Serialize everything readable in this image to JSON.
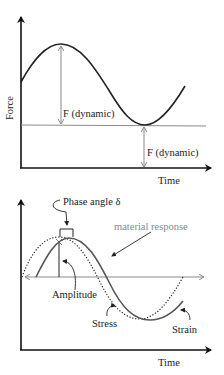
{
  "figure": {
    "top_panel": {
      "y_axis_label": "Force",
      "x_axis_label": "Time",
      "annotations": [
        "F (dynamic)",
        "F (dynamic)"
      ],
      "curve": "sinusoidal force"
    },
    "bottom_panel": {
      "x_axis_label": "Time",
      "annotations": {
        "phase_angle": "Phase angle δ",
        "material_response": "material response",
        "amplitude": "Amplitude",
        "stress": "Stress",
        "strain": "Strain"
      },
      "curves": [
        "Stress (dotted)",
        "Strain (solid)"
      ]
    },
    "colors": {
      "axis": "#111111",
      "curve": "#222222",
      "strain_curve": "#555555",
      "guide_line": "#8a8a8a",
      "material_response_text": "#8a8a8a"
    }
  }
}
